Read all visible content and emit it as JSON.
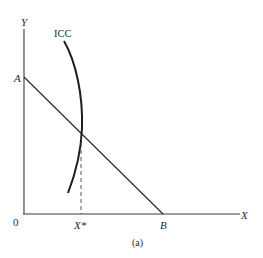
{
  "diagram": {
    "caption": "(a)",
    "axes": {
      "y_label": "Y",
      "x_label": "X",
      "origin_label": "0"
    },
    "points": {
      "A": "A",
      "B": "B",
      "x_star": "X*"
    },
    "curves": {
      "icc_label": "ICC"
    },
    "colors": {
      "ink": "#2a2a2a",
      "background": "#ffffff"
    }
  }
}
